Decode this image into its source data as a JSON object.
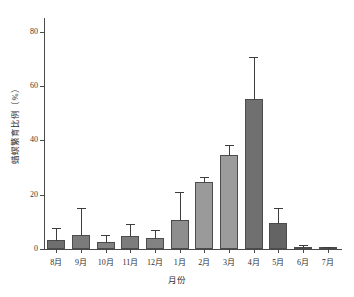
{
  "chart_data": {
    "type": "bar",
    "title": "",
    "xlabel": "月份",
    "ylabel": "蜡螟繁育比例（%）",
    "categories": [
      "8月",
      "9月",
      "10月",
      "11月",
      "12月",
      "1月",
      "2月",
      "3月",
      "4月",
      "5月",
      "6月",
      "7月"
    ],
    "values": [
      3.2,
      5.2,
      2.4,
      4.8,
      4.0,
      10.6,
      24.5,
      34.6,
      55.3,
      9.5,
      0.8,
      0.2
    ],
    "errors_upper": [
      4.0,
      9.5,
      2.3,
      4.2,
      2.7,
      10.1,
      1.6,
      3.2,
      14.9,
      5.2,
      0.4,
      0.3
    ],
    "bar_colors": [
      "#6f6f6f",
      "#7b7b7b",
      "#818181",
      "#7c7c7c",
      "#828282",
      "#8e8e8e",
      "#9a9a9a",
      "#9c9c9c",
      "#707070",
      "#646464",
      "#5d5d5d",
      "#5d5d5d"
    ],
    "ylim": [
      0,
      85
    ],
    "yticks": [
      0,
      20,
      40,
      60,
      80
    ],
    "ytick_labels": [
      "0",
      "20",
      "40",
      "60",
      "80"
    ],
    "grid": false,
    "legend": "none",
    "error_bar_style": "upper-only-with-caps",
    "axis_color": "#4a4a4a",
    "text_color": "#2e2e2e"
  }
}
